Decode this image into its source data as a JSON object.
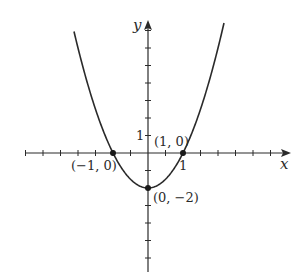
{
  "chart_data": {
    "type": "line",
    "title": "",
    "function": "y = 2x^2 - 2",
    "xlabel": "x",
    "ylabel": "y",
    "x_tick_step": 0.5,
    "y_tick_step": 1,
    "xlim": [
      -3.5,
      4
    ],
    "ylim": [
      -6.8,
      7.5
    ],
    "grid": false,
    "x_tick_labels": [
      {
        "value": 1,
        "label": "1"
      }
    ],
    "y_tick_labels": [
      {
        "value": 1,
        "label": "1"
      }
    ],
    "series": [
      {
        "name": "parabola",
        "x": [
          -2.11,
          -1.5,
          -1,
          -0.5,
          0,
          0.5,
          1,
          1.5,
          2.18
        ],
        "y": [
          6.9,
          2.5,
          0,
          -1.5,
          -2,
          -1.5,
          0,
          2.5,
          7.5
        ]
      }
    ],
    "points": [
      {
        "x": -1,
        "y": 0,
        "label": "(−1, 0)"
      },
      {
        "x": 1,
        "y": 0,
        "label": "(1, 0)"
      },
      {
        "x": 0,
        "y": -2,
        "label": "(0, −2)"
      }
    ]
  },
  "labels": {
    "x_axis": "x",
    "y_axis": "y",
    "x_tick_one": "1",
    "y_tick_one": "1",
    "point_left": "(−1, 0)",
    "point_right": "(1, 0)",
    "point_vertex": "(0, −2)"
  },
  "colors": {
    "ink": "#2a2a2a",
    "background": "#ffffff"
  }
}
